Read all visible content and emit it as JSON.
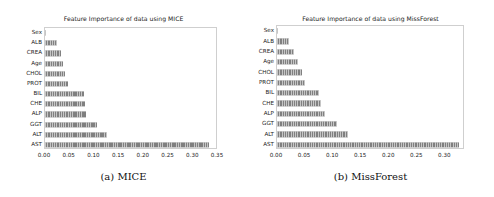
{
  "figure": {
    "background": "#ffffff",
    "bar_color": "#808080",
    "frame_color": "#cfcfcf"
  },
  "panels": [
    {
      "id": "mice",
      "caption": "(a) MICE",
      "chart_data": {
        "type": "bar",
        "orientation": "horizontal",
        "title": "Feature Importance of data using MICE",
        "xlabel": "",
        "ylabel": "",
        "categories": [
          "Sex",
          "ALB",
          "CREA",
          "Age",
          "CHOL",
          "PROT",
          "BIL",
          "CHE",
          "ALP",
          "GGT",
          "ALT",
          "AST"
        ],
        "values": [
          0.001,
          0.024,
          0.033,
          0.037,
          0.04,
          0.047,
          0.078,
          0.08,
          0.083,
          0.105,
          0.126,
          0.331
        ],
        "xlim": [
          0.0,
          0.35
        ],
        "xticks": [
          0.0,
          0.05,
          0.1,
          0.15,
          0.2,
          0.25,
          0.3,
          0.35
        ],
        "xticklabels": [
          "0.00",
          "0.05",
          "0.10",
          "0.15",
          "0.20",
          "0.25",
          "0.30",
          "0.35"
        ],
        "grid": false,
        "legend": false
      }
    },
    {
      "id": "missforest",
      "caption": "(b) MissForest",
      "chart_data": {
        "type": "bar",
        "orientation": "horizontal",
        "title": "Feature Importance of data using MissForest",
        "xlabel": "",
        "ylabel": "",
        "categories": [
          "Sex",
          "ALB",
          "CREA",
          "Age",
          "CHOL",
          "PROT",
          "BIL",
          "CHE",
          "ALP",
          "GGT",
          "ALT",
          "AST"
        ],
        "values": [
          0.001,
          0.021,
          0.03,
          0.037,
          0.044,
          0.05,
          0.074,
          0.079,
          0.085,
          0.107,
          0.126,
          0.324
        ],
        "xlim": [
          0.0,
          0.335
        ],
        "xticks": [
          0.0,
          0.05,
          0.1,
          0.15,
          0.2,
          0.25,
          0.3
        ],
        "xticklabels": [
          "0.00",
          "0.05",
          "0.10",
          "0.15",
          "0.20",
          "0.25",
          "0.30"
        ],
        "grid": false,
        "legend": false
      }
    }
  ]
}
